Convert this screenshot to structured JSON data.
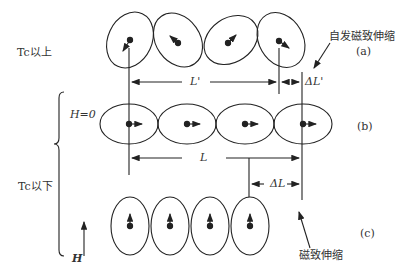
{
  "labels": {
    "above_tc": "Tc以上",
    "below_tc": "Tc以下",
    "h_zero": "H=0",
    "h_field": "H",
    "l_prime": "L'",
    "delta_l_prime": "ΔL'",
    "l": "L",
    "delta_l": "ΔL",
    "spontaneous": "自发磁致伸缩",
    "magnetostriction": "磁致伸缩",
    "panel_a": "(a)",
    "panel_b": "(b)",
    "panel_c": "(c)"
  },
  "colors": {
    "stroke": "#222222",
    "text": "#333333"
  }
}
